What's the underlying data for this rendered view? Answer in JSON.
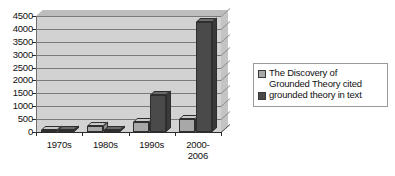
{
  "chart_data": {
    "type": "bar",
    "title": "",
    "subtitle": "",
    "xlabel": "",
    "ylabel": "",
    "categories": [
      "1970s",
      "1980s",
      "1990s",
      "2000-\n2006"
    ],
    "series": [
      {
        "name": "The Discovery of Grounded Theory cited",
        "values": [
          80,
          250,
          370,
          520
        ],
        "color": "#a8a8a8"
      },
      {
        "name": "grounded theory in text",
        "values": [
          30,
          60,
          1450,
          4250
        ],
        "color": "#4a4a4a"
      }
    ],
    "ylim": [
      0,
      4500
    ],
    "ytick_step": 500,
    "yticks": [
      "0",
      "500",
      "1000",
      "1500",
      "2000",
      "2500",
      "3000",
      "3500",
      "4000",
      "4500"
    ],
    "grid": true,
    "legend_position": "right",
    "style": "3d-clustered-column",
    "plot_background": "#d2d2d2",
    "gridline_color": "#7a7a7a"
  },
  "legend": {
    "entries": [
      {
        "label_line1": "The Discovery of",
        "label_line2": "Grounded Theory cited",
        "swatch_color": "#a8a8a8"
      },
      {
        "label_line1": "grounded theory in text",
        "label_line2": "",
        "swatch_color": "#4a4a4a"
      }
    ]
  }
}
